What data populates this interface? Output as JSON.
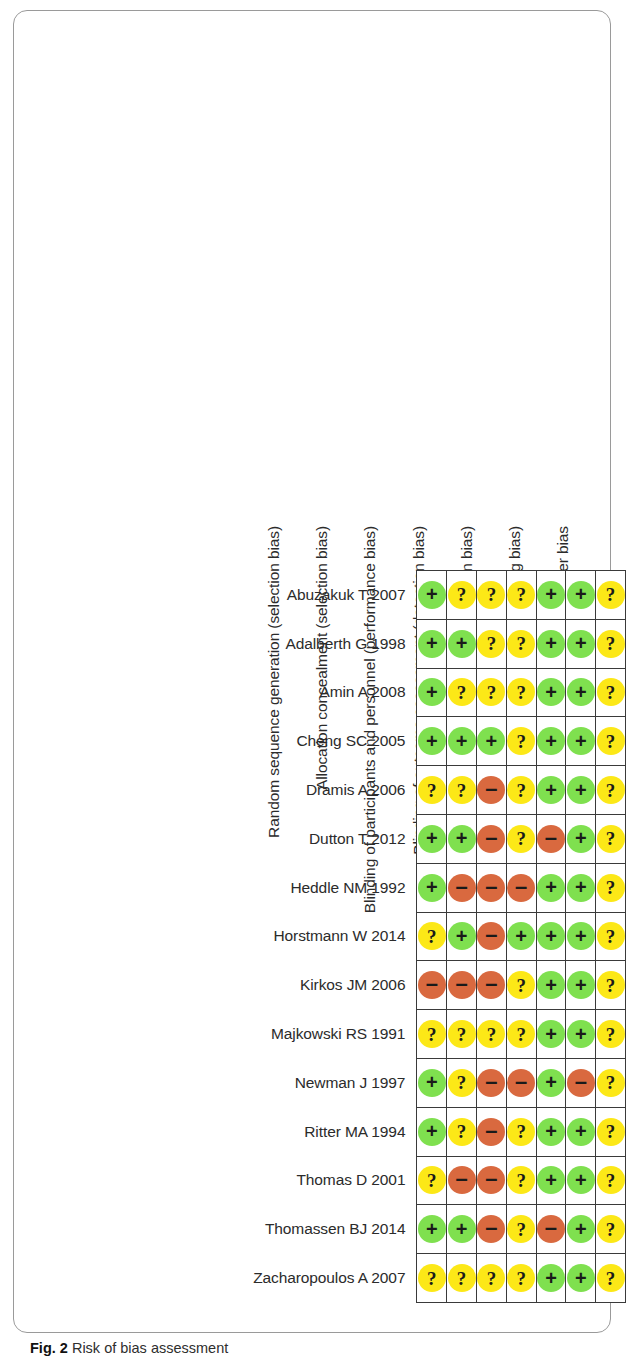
{
  "caption": {
    "figure_number": "Fig. 2",
    "text": "Risk of bias assessment"
  },
  "colors": {
    "low_risk": "#7FE04F",
    "unclear_risk": "#FCE817",
    "high_risk": "#D9693F",
    "grid_line": "#3a3a3a",
    "frame": "#9a9a9a",
    "text": "#2b2b2b"
  },
  "legend_glyphs": {
    "low_risk": "+",
    "unclear_risk": "?",
    "high_risk": "–"
  },
  "chart_data": {
    "type": "heatmap",
    "title": "Risk of bias assessment",
    "xlabel": "",
    "ylabel": "",
    "categories": [
      "Random sequence generation (selection bias)",
      "Allocation concealment (selection bias)",
      "Blinding of participants and personnel (performance bias)",
      "Blinding of outcome assessment (detection bias)",
      "Incomplete outcome data (attrition bias)",
      "Selective reporting (reporting bias)",
      "Other bias"
    ],
    "value_scale": {
      "low": "Low risk of bias",
      "unclear": "Unclear risk of bias",
      "high": "High risk of bias"
    },
    "rows": [
      {
        "study": "Abuzakuk T 2007",
        "values": [
          "low",
          "unclear",
          "unclear",
          "unclear",
          "low",
          "low",
          "unclear"
        ]
      },
      {
        "study": "Adalberth G 1998",
        "values": [
          "low",
          "low",
          "unclear",
          "unclear",
          "low",
          "low",
          "unclear"
        ]
      },
      {
        "study": "Amin A 2008",
        "values": [
          "low",
          "unclear",
          "unclear",
          "unclear",
          "low",
          "low",
          "unclear"
        ]
      },
      {
        "study": "Cheng SC 2005",
        "values": [
          "low",
          "low",
          "low",
          "unclear",
          "low",
          "low",
          "unclear"
        ]
      },
      {
        "study": "Dramis A 2006",
        "values": [
          "unclear",
          "unclear",
          "high",
          "unclear",
          "low",
          "low",
          "unclear"
        ]
      },
      {
        "study": "Dutton T 2012",
        "values": [
          "low",
          "low",
          "high",
          "unclear",
          "high",
          "low",
          "unclear"
        ]
      },
      {
        "study": "Heddle NM 1992",
        "values": [
          "low",
          "high",
          "high",
          "high",
          "low",
          "low",
          "unclear"
        ]
      },
      {
        "study": "Horstmann W 2014",
        "values": [
          "unclear",
          "low",
          "high",
          "low",
          "low",
          "low",
          "unclear"
        ]
      },
      {
        "study": "Kirkos JM 2006",
        "values": [
          "high",
          "high",
          "high",
          "unclear",
          "low",
          "low",
          "unclear"
        ]
      },
      {
        "study": "Majkowski RS 1991",
        "values": [
          "unclear",
          "unclear",
          "unclear",
          "unclear",
          "low",
          "low",
          "unclear"
        ]
      },
      {
        "study": "Newman J 1997",
        "values": [
          "low",
          "unclear",
          "high",
          "high",
          "low",
          "high",
          "unclear"
        ]
      },
      {
        "study": "Ritter MA 1994",
        "values": [
          "low",
          "unclear",
          "high",
          "unclear",
          "low",
          "low",
          "unclear"
        ]
      },
      {
        "study": "Thomas D 2001",
        "values": [
          "unclear",
          "high",
          "high",
          "unclear",
          "low",
          "low",
          "unclear"
        ]
      },
      {
        "study": "Thomassen BJ 2014",
        "values": [
          "low",
          "low",
          "high",
          "unclear",
          "high",
          "low",
          "unclear"
        ]
      },
      {
        "study": "Zacharopoulos A 2007",
        "values": [
          "unclear",
          "unclear",
          "unclear",
          "unclear",
          "low",
          "low",
          "unclear"
        ]
      }
    ]
  }
}
